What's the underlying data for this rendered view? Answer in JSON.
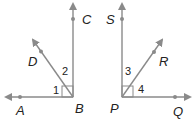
{
  "figure_left": {
    "vertex": "B",
    "points": {
      "A": "A",
      "B": "B",
      "C": "C",
      "D": "D"
    },
    "angles": {
      "angle1": "1",
      "angle2": "2"
    }
  },
  "figure_right": {
    "vertex": "P",
    "points": {
      "S": "S",
      "P": "P",
      "R": "R",
      "Q": "Q"
    },
    "angles": {
      "angle3": "3",
      "angle4": "4"
    }
  },
  "colors": {
    "ray": "#8a8a8a",
    "point": "#8a8a8a",
    "text": "#222222"
  }
}
